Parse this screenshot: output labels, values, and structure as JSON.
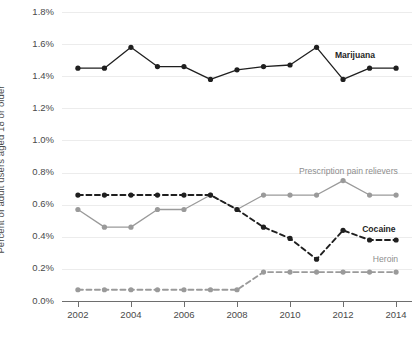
{
  "chart_data": {
    "type": "line",
    "title": "",
    "xlabel": "",
    "ylabel": "Percent of adult users aged 18 or older",
    "x": [
      2002,
      2003,
      2004,
      2005,
      2006,
      2007,
      2008,
      2009,
      2010,
      2011,
      2012,
      2013,
      2014
    ],
    "xtick_labels": [
      "2002",
      "2004",
      "2006",
      "2008",
      "2010",
      "2012",
      "2014"
    ],
    "xticks": [
      2002,
      2004,
      2006,
      2008,
      2010,
      2012,
      2014
    ],
    "xlim": [
      2001.4,
      2014.6
    ],
    "ylim": [
      0.0,
      1.8
    ],
    "ytick_labels": [
      "0.0%",
      "0.2%",
      "0.4%",
      "0.6%",
      "0.8%",
      "1.0%",
      "1.2%",
      "1.4%",
      "1.6%",
      "1.8%"
    ],
    "yticks": [
      0.0,
      0.2,
      0.4,
      0.6,
      0.8,
      1.0,
      1.2,
      1.4,
      1.6,
      1.8
    ],
    "grid": true,
    "legend_position": "inline-end-of-line",
    "series": [
      {
        "name": "Marijuana",
        "label": "Marijuana",
        "color": "#1f1f1f",
        "style": "solid",
        "label_style": "dark",
        "values": [
          1.45,
          1.45,
          1.58,
          1.46,
          1.46,
          1.38,
          1.44,
          1.46,
          1.47,
          1.58,
          1.38,
          1.45,
          1.45
        ]
      },
      {
        "name": "Prescription pain relievers",
        "label": "Prescription pain relievers",
        "color": "#9a9a9a",
        "style": "solid",
        "label_style": "light",
        "values": [
          0.57,
          0.46,
          0.46,
          0.57,
          0.57,
          0.66,
          0.57,
          0.66,
          0.66,
          0.66,
          0.75,
          0.66,
          0.66
        ]
      },
      {
        "name": "Cocaine",
        "label": "Cocaine",
        "color": "#1f1f1f",
        "style": "dashed",
        "label_style": "dark",
        "values": [
          0.66,
          0.66,
          0.66,
          0.66,
          0.66,
          0.66,
          0.57,
          0.46,
          0.39,
          0.26,
          0.44,
          0.38,
          0.38
        ]
      },
      {
        "name": "Heroin",
        "label": "Heroin",
        "color": "#9a9a9a",
        "style": "dashed",
        "label_style": "light",
        "values": [
          0.07,
          0.07,
          0.07,
          0.07,
          0.07,
          0.07,
          0.07,
          0.18,
          0.18,
          0.18,
          0.18,
          0.18,
          0.18
        ]
      }
    ],
    "series_labels": [
      {
        "text": "Marijuana",
        "x": 2012.45,
        "y": 1.525,
        "style": "dark",
        "anchor": "middle"
      },
      {
        "text": "Prescription pain relievers",
        "x": 2012.2,
        "y": 0.805,
        "style": "light",
        "anchor": "middle"
      },
      {
        "text": "Cocaine",
        "x": 2013.35,
        "y": 0.445,
        "style": "dark",
        "anchor": "middle"
      },
      {
        "text": "Heroin",
        "x": 2013.6,
        "y": 0.255,
        "style": "light",
        "anchor": "middle"
      }
    ]
  }
}
